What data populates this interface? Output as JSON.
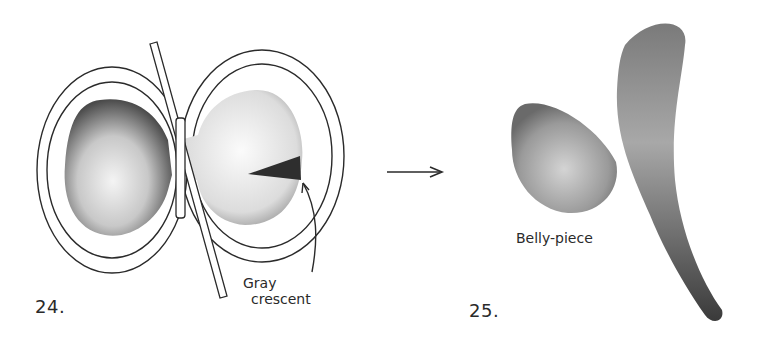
{
  "figures": [
    {
      "number": "24.",
      "annotation": {
        "line1": "Gray",
        "line2": "crescent"
      }
    },
    {
      "number": "25.",
      "annotation": "Belly-piece"
    }
  ],
  "arrow": "right-arrow",
  "colors": {
    "ink": "#2a2a2a",
    "stipple_dark": "#555555",
    "background": "#ffffff"
  }
}
